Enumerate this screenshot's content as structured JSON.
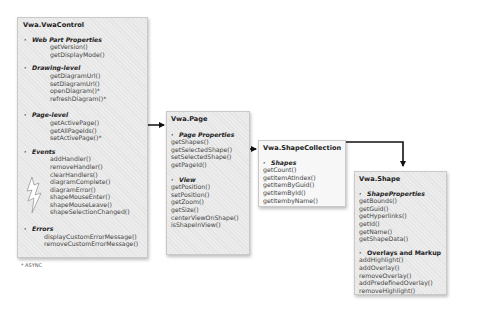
{
  "diagram": {
    "footnote": "* ASYNC",
    "boxes": {
      "vwa_control": {
        "title": "Vwa.VwaControl",
        "sections": [
          {
            "label": "Web Part Properties",
            "items": [
              "getVersion()",
              "getDisplayMode()"
            ]
          },
          {
            "label": "Drawing-level",
            "items": [
              "getDiagramUrl()",
              "setDiagramUrl()",
              "openDiagram()*",
              "refreshDiagram()*"
            ]
          },
          {
            "label": "Page-level",
            "items": [
              "getActivePage()",
              "getAllPageIds()",
              "setActivePage()*"
            ]
          },
          {
            "label": "Events",
            "items": [
              "addHandler()",
              "removeHandler()",
              "clearHandlers()",
              "diagramComplete()",
              "diagramError()",
              "shapeMouseEnter()",
              "shapeMouseLeave()",
              "shapeSelectionChanged()"
            ]
          },
          {
            "label": "Errors",
            "items": [
              "displayCustomErrorMessage()",
              "removeCustomErrorMessage()"
            ]
          }
        ]
      },
      "vwa_page": {
        "title": "Vwa.Page",
        "sections": [
          {
            "label": "Page Properties",
            "items": [
              "getShapes()",
              "getSelectedShape()",
              "setSelectedShape()",
              "getPageId()"
            ]
          },
          {
            "label": "View",
            "items": [
              "getPosition()",
              "setPosition()",
              "getZoom()",
              "getSize()",
              "centerViewOnShape()",
              "isShapeInView()"
            ]
          }
        ]
      },
      "vwa_shape_collection": {
        "title": "Vwa.ShapeCollection",
        "sections": [
          {
            "label": "Shapes",
            "items": [
              "getCount()",
              "getItemAtIndex()",
              "getItemByGuid()",
              "getItemById()",
              "getItembyName()"
            ]
          }
        ]
      },
      "vwa_shape": {
        "title": "Vwa.Shape",
        "sections": [
          {
            "label": "ShapeProperties",
            "items": [
              "getBounds()",
              "getGuid()",
              "getHyperlinks()",
              "getId()",
              "getName()",
              "getShapeData()"
            ]
          },
          {
            "label": "Overlays and Markup",
            "items": [
              "addHighlight()",
              "addOverlay()",
              "removeOverlay()",
              "addPredefinedOverlay()",
              "removeHighlight()"
            ]
          }
        ]
      }
    },
    "connectors": [
      {
        "from": "Vwa.VwaControl: Page-level",
        "to": "Vwa.Page"
      },
      {
        "from": "Vwa.Page: getShapes()",
        "to": "Vwa.ShapeCollection"
      },
      {
        "from": "Vwa.ShapeCollection",
        "to": "Vwa.Shape"
      }
    ],
    "colors": {
      "box_bg": "#f5f5f5",
      "box_border": "#c9c9c9",
      "arrow": "#111111",
      "text": "#444444"
    }
  }
}
